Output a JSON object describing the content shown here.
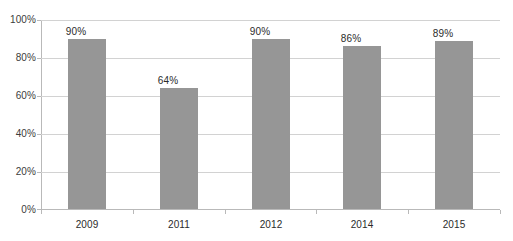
{
  "chart_data": {
    "type": "bar",
    "title": "",
    "subtitle": "",
    "xlabel": "",
    "ylabel": "",
    "categories": [
      "2009",
      "2011",
      "2012",
      "2014",
      "2015"
    ],
    "values": [
      90,
      64,
      90,
      86,
      89
    ],
    "data_labels": [
      "90%",
      "64%",
      "90%",
      "86%",
      "89%"
    ],
    "ylim": [
      0,
      100
    ],
    "y_ticks": [
      0,
      20,
      40,
      60,
      80,
      100
    ],
    "y_tick_labels": [
      "0%",
      "20%",
      "40%",
      "60%",
      "80%",
      "100%"
    ],
    "grid": true,
    "legend": false,
    "legend_position": "none",
    "series": [
      {
        "name": "",
        "values": [
          90,
          64,
          90,
          86,
          89
        ]
      }
    ],
    "colors": {
      "bar": "#969696",
      "gridline": "#d2d2d2",
      "axis": "#b9b9b9",
      "tick_label": "#3c3c3c",
      "data_label": "#2b2b2b",
      "background": "#ffffff"
    }
  }
}
